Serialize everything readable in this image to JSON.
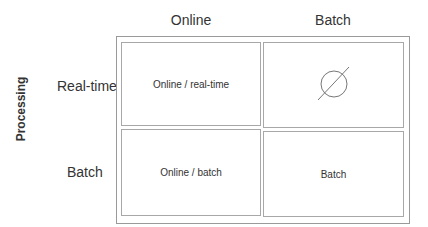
{
  "diagram": {
    "axis_label": "Processing",
    "columns": [
      {
        "label": "Online"
      },
      {
        "label": "Batch"
      }
    ],
    "rows": [
      {
        "label": "Real-time"
      },
      {
        "label": "Batch"
      }
    ],
    "cells": [
      {
        "row": 0,
        "col": 0,
        "label": "Online / real-time"
      },
      {
        "row": 0,
        "col": 1,
        "label": "",
        "icon": "empty-set-icon"
      },
      {
        "row": 1,
        "col": 0,
        "label": "Online / batch"
      },
      {
        "row": 1,
        "col": 1,
        "label": "Batch"
      }
    ]
  }
}
